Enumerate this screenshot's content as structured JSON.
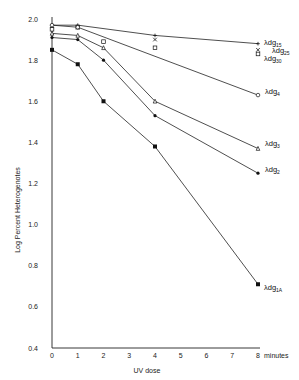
{
  "caption": "",
  "chart_data": {
    "type": "line",
    "title": "",
    "xlabel": "UV dose",
    "xunit": "minutes",
    "ylabel": "Log Percent Heterogenotes",
    "xlim": [
      0,
      8
    ],
    "ylim": [
      0.4,
      2.0
    ],
    "xticks": [
      0,
      1,
      2,
      3,
      4,
      5,
      6,
      7,
      8
    ],
    "yticks": [
      "0.4",
      "0.6",
      "0.8",
      "1.0",
      "1.2",
      "1.4",
      "1.6",
      "1.8",
      "2.0"
    ],
    "grid": false,
    "legend_position": "inline-right",
    "series": [
      {
        "name": "λdg15",
        "base": "λdg",
        "sub": "15",
        "marker": "plus",
        "x": [
          0,
          1,
          4,
          8
        ],
        "values": [
          1.97,
          1.97,
          1.92,
          1.88
        ]
      },
      {
        "name": "λdg25",
        "base": "λdg",
        "sub": "25",
        "marker": "cross",
        "x": [
          0,
          1,
          4,
          8
        ],
        "values": [
          1.96,
          1.96,
          1.9,
          1.85
        ]
      },
      {
        "name": "λdg30",
        "base": "λdg",
        "sub": "30",
        "marker": "open-square",
        "x": [
          0,
          1,
          2,
          4,
          8
        ],
        "values": [
          1.95,
          1.96,
          1.89,
          1.86,
          1.83
        ]
      },
      {
        "name": "λdg4",
        "base": "λdg",
        "sub": "4",
        "marker": "open-circle",
        "x": [
          0,
          1,
          8
        ],
        "values": [
          1.97,
          1.96,
          1.63
        ]
      },
      {
        "name": "λdg3",
        "base": "λdg",
        "sub": "3",
        "marker": "open-triangle",
        "x": [
          0,
          1,
          2,
          4,
          8
        ],
        "values": [
          1.93,
          1.92,
          1.86,
          1.6,
          1.37
        ]
      },
      {
        "name": "λdg2",
        "base": "λdg",
        "sub": "2",
        "marker": "filled-circle",
        "x": [
          0,
          1,
          2,
          4,
          8
        ],
        "values": [
          1.91,
          1.9,
          1.8,
          1.53,
          1.25
        ]
      },
      {
        "name": "λdg1A",
        "base": "λdg",
        "sub": "1A",
        "marker": "filled-square",
        "x": [
          0,
          1,
          2,
          4,
          8
        ],
        "values": [
          1.85,
          1.78,
          1.6,
          1.38,
          0.71
        ]
      }
    ]
  }
}
